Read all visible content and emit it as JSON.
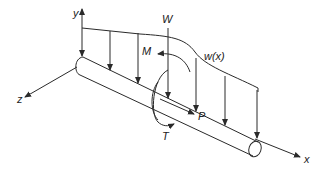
{
  "diagram": {
    "type": "beam-loading",
    "labels": {
      "y_axis": "y",
      "z_axis": "z",
      "x_axis": "x",
      "point_load": "W",
      "moment": "M",
      "distributed_load": "w(x)",
      "axial_force": "P",
      "torque": "T"
    },
    "colors": {
      "stroke": "#2a2a2a",
      "background": "#ffffff"
    }
  }
}
